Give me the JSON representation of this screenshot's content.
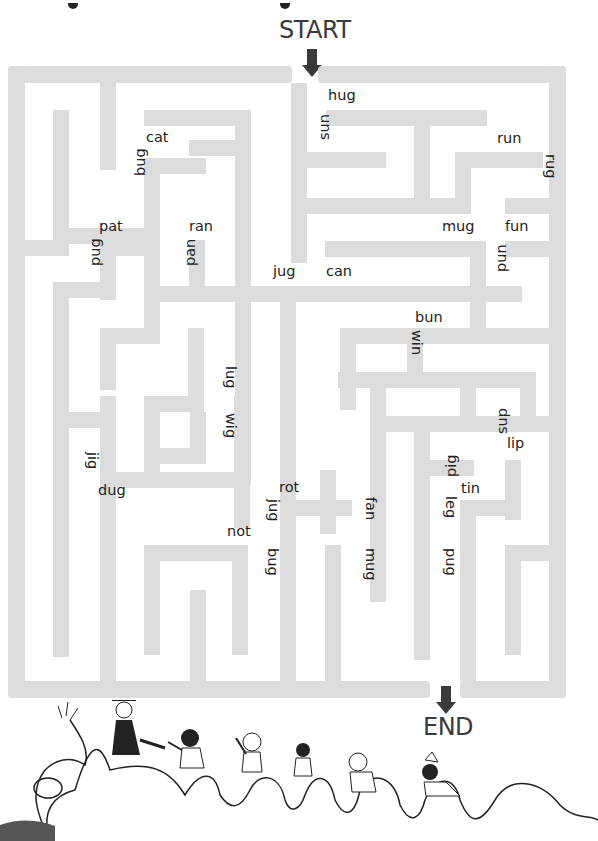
{
  "labels": {
    "start": "START",
    "end": "END"
  },
  "colors": {
    "wall": "#dcdcdc",
    "arrow": "#3a3a3a",
    "text": "#222222",
    "background": "#ffffff"
  },
  "maze": {
    "outer_frame": {
      "x": 8,
      "y": 66,
      "w": 558,
      "h": 632,
      "thickness": 17
    },
    "start_gap": {
      "x": 292,
      "w": 26
    },
    "end_gap": {
      "x": 430,
      "w": 30
    },
    "walls": [
      [
        8,
        66,
        284,
        17
      ],
      [
        318,
        66,
        248,
        17
      ],
      [
        8,
        66,
        17,
        632
      ],
      [
        549,
        66,
        17,
        632
      ],
      [
        8,
        681,
        422,
        17
      ],
      [
        460,
        681,
        106,
        17
      ],
      [
        100,
        83,
        16,
        87
      ],
      [
        53,
        110,
        16,
        134
      ],
      [
        53,
        228,
        96,
        16
      ],
      [
        144,
        110,
        107,
        16
      ],
      [
        235,
        110,
        16,
        184
      ],
      [
        146,
        158,
        60,
        16
      ],
      [
        144,
        158,
        16,
        160
      ],
      [
        189,
        140,
        60,
        16
      ],
      [
        326,
        110,
        161,
        16
      ],
      [
        414,
        110,
        16,
        88
      ],
      [
        291,
        152,
        95,
        16
      ],
      [
        291,
        83,
        16,
        180
      ],
      [
        291,
        198,
        171,
        16
      ],
      [
        455,
        152,
        88,
        16
      ],
      [
        455,
        152,
        16,
        62
      ],
      [
        505,
        198,
        44,
        16
      ],
      [
        505,
        241,
        44,
        16
      ],
      [
        25,
        240,
        44,
        16
      ],
      [
        100,
        240,
        52,
        16
      ],
      [
        100,
        240,
        16,
        60
      ],
      [
        53,
        282,
        63,
        16
      ],
      [
        53,
        282,
        16,
        375
      ],
      [
        189,
        240,
        16,
        60
      ],
      [
        144,
        282,
        16,
        60
      ],
      [
        325,
        241,
        160,
        16
      ],
      [
        470,
        241,
        16,
        90
      ],
      [
        146,
        286,
        376,
        16
      ],
      [
        280,
        286,
        16,
        395
      ],
      [
        235,
        286,
        16,
        200
      ],
      [
        100,
        328,
        16,
        62
      ],
      [
        100,
        328,
        60,
        16
      ],
      [
        188,
        328,
        16,
        82
      ],
      [
        144,
        396,
        60,
        16
      ],
      [
        340,
        328,
        70,
        16
      ],
      [
        340,
        328,
        16,
        82
      ],
      [
        407,
        328,
        145,
        16
      ],
      [
        407,
        328,
        16,
        60
      ],
      [
        338,
        372,
        84,
        16
      ],
      [
        234,
        396,
        16,
        132
      ],
      [
        100,
        396,
        16,
        120
      ],
      [
        53,
        412,
        63,
        16
      ],
      [
        144,
        448,
        60,
        16
      ],
      [
        144,
        412,
        16,
        76
      ],
      [
        190,
        412,
        16,
        52
      ],
      [
        100,
        472,
        150,
        16
      ],
      [
        100,
        472,
        16,
        209
      ],
      [
        144,
        545,
        88,
        16
      ],
      [
        144,
        545,
        16,
        110
      ],
      [
        232,
        545,
        16,
        110
      ],
      [
        190,
        590,
        16,
        91
      ],
      [
        370,
        372,
        16,
        230
      ],
      [
        370,
        372,
        120,
        16
      ],
      [
        460,
        372,
        60,
        16
      ],
      [
        460,
        372,
        16,
        60
      ],
      [
        520,
        372,
        16,
        60
      ],
      [
        414,
        416,
        16,
        60
      ],
      [
        370,
        416,
        95,
        16
      ],
      [
        460,
        416,
        90,
        16
      ],
      [
        292,
        500,
        60,
        16
      ],
      [
        320,
        470,
        16,
        64
      ],
      [
        414,
        460,
        16,
        200
      ],
      [
        414,
        460,
        60,
        16
      ],
      [
        505,
        460,
        16,
        60
      ],
      [
        460,
        500,
        60,
        16
      ],
      [
        460,
        500,
        16,
        181
      ],
      [
        505,
        545,
        44,
        16
      ],
      [
        505,
        545,
        16,
        110
      ],
      [
        325,
        545,
        16,
        136
      ],
      [
        280,
        590,
        16,
        91
      ]
    ]
  },
  "words": [
    {
      "text": "hug",
      "x": 328,
      "y": 88,
      "rot": 0
    },
    {
      "text": "sun",
      "x": 317,
      "y": 112,
      "rot": 270
    },
    {
      "text": "cat",
      "x": 146,
      "y": 130,
      "rot": 0
    },
    {
      "text": "bug",
      "x": 133,
      "y": 148,
      "rot": 270
    },
    {
      "text": "run",
      "x": 497,
      "y": 131,
      "rot": 0
    },
    {
      "text": "rug",
      "x": 544,
      "y": 154,
      "rot": 90
    },
    {
      "text": "pat",
      "x": 99,
      "y": 219,
      "rot": 0
    },
    {
      "text": "pug",
      "x": 88,
      "y": 238,
      "rot": 270
    },
    {
      "text": "ran",
      "x": 189,
      "y": 219,
      "rot": 0
    },
    {
      "text": "pan",
      "x": 183,
      "y": 238,
      "rot": 270
    },
    {
      "text": "mug",
      "x": 442,
      "y": 219,
      "rot": 0
    },
    {
      "text": "fun",
      "x": 505,
      "y": 219,
      "rot": 0
    },
    {
      "text": "pun",
      "x": 494,
      "y": 244,
      "rot": 270
    },
    {
      "text": "jug",
      "x": 273,
      "y": 264,
      "rot": 0
    },
    {
      "text": "can",
      "x": 326,
      "y": 264,
      "rot": 0
    },
    {
      "text": "bun",
      "x": 415,
      "y": 310,
      "rot": 0
    },
    {
      "text": "win",
      "x": 410,
      "y": 330,
      "rot": 90
    },
    {
      "text": "lug",
      "x": 224,
      "y": 366,
      "rot": 90
    },
    {
      "text": "wig",
      "x": 224,
      "y": 413,
      "rot": 90
    },
    {
      "text": "sup",
      "x": 495,
      "y": 406,
      "rot": 270
    },
    {
      "text": "lip",
      "x": 507,
      "y": 436,
      "rot": 0
    },
    {
      "text": "jig",
      "x": 86,
      "y": 452,
      "rot": 90
    },
    {
      "text": "pig",
      "x": 444,
      "y": 449,
      "rot": 270
    },
    {
      "text": "dug",
      "x": 98,
      "y": 483,
      "rot": 0
    },
    {
      "text": "rot",
      "x": 279,
      "y": 480,
      "rot": 0
    },
    {
      "text": "tin",
      "x": 461,
      "y": 481,
      "rot": 0
    },
    {
      "text": "fan",
      "x": 364,
      "y": 497,
      "rot": 90
    },
    {
      "text": "leg",
      "x": 444,
      "y": 496,
      "rot": 90
    },
    {
      "text": "jug",
      "x": 267,
      "y": 499,
      "rot": 90
    },
    {
      "text": "not",
      "x": 227,
      "y": 524,
      "rot": 0
    },
    {
      "text": "bug",
      "x": 266,
      "y": 548,
      "rot": 90
    },
    {
      "text": "mug",
      "x": 364,
      "y": 548,
      "rot": 90
    },
    {
      "text": "pug",
      "x": 444,
      "y": 548,
      "rot": 90
    }
  ],
  "illustration": {
    "description": "camel with riders",
    "riders": 6
  }
}
